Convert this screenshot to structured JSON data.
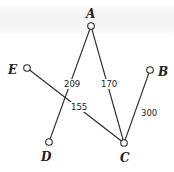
{
  "diagram": {
    "type": "weighted-graph",
    "nodes": [
      {
        "id": "A",
        "label": "A",
        "x": 91,
        "y": 26,
        "lx": 90,
        "ly": 18
      },
      {
        "id": "B",
        "label": "B",
        "x": 150,
        "y": 70,
        "lx": 162,
        "ly": 76
      },
      {
        "id": "C",
        "label": "C",
        "x": 124,
        "y": 143,
        "lx": 125,
        "ly": 161
      },
      {
        "id": "D",
        "label": "D",
        "x": 49,
        "y": 142,
        "lx": 46,
        "ly": 160
      },
      {
        "id": "E",
        "label": "E",
        "x": 27,
        "y": 68,
        "lx": 14,
        "ly": 74
      }
    ],
    "edges": [
      {
        "from": "A",
        "to": "D",
        "weight": "209",
        "lx": 72,
        "ly": 86
      },
      {
        "from": "A",
        "to": "C",
        "weight": "170",
        "lx": 109,
        "ly": 86
      },
      {
        "from": "E",
        "to": "C",
        "weight": "155",
        "lx": 78,
        "ly": 110
      },
      {
        "from": "B",
        "to": "C",
        "weight": "300",
        "lx": 148,
        "ly": 116
      }
    ]
  },
  "labels": {
    "A": "A",
    "B": "B",
    "C": "C",
    "D": "D",
    "E": "E",
    "w_AD": "209",
    "w_AC": "170",
    "w_EC": "155",
    "w_BC": "300"
  }
}
